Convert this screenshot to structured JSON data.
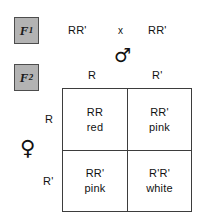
{
  "diagram": {
    "generations": {
      "f1": {
        "label": "F",
        "subscript": "1"
      },
      "f2": {
        "label": "F",
        "subscript": "2"
      }
    },
    "cross": {
      "left_parent": "RR'",
      "operator": "x",
      "right_parent": "RR'"
    },
    "symbols": {
      "male": "♂",
      "female": "♀"
    },
    "axes": {
      "male_gametes": [
        "R",
        "R'"
      ],
      "female_gametes": [
        "R",
        "R'"
      ]
    },
    "cells": [
      {
        "genotype": "RR",
        "phenotype": "red"
      },
      {
        "genotype": "RR'",
        "phenotype": "pink"
      },
      {
        "genotype": "RR'",
        "phenotype": "pink"
      },
      {
        "genotype": "R'R'",
        "phenotype": "white"
      }
    ],
    "colors": {
      "chip_fill": "#b3b3b3",
      "chip_border": "#4d4d4d",
      "grid_line": "#3d3d3d",
      "text": "#111111",
      "background": "#ffffff"
    }
  }
}
